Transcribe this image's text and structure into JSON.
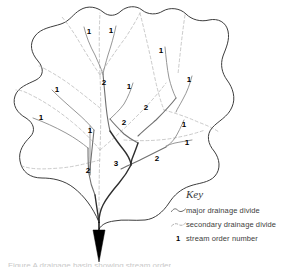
{
  "figure": {
    "type": "drainage-basin-stream-order-diagram",
    "background_color": "#ffffff"
  },
  "legend": {
    "title": "Key",
    "items": [
      {
        "symbol": "wavy-solid-line",
        "label": "major drainage divide"
      },
      {
        "symbol": "dashed-line",
        "label": "secondary drainage divide"
      },
      {
        "symbol": "bold-number",
        "symbol_text": "1",
        "label": "stream order number"
      }
    ]
  },
  "colors": {
    "major_divide": "#3d3d3d",
    "secondary_divide": "#bdbdbd",
    "stream": "#8a8a8a",
    "trunk_stream": "#2e2e2e",
    "label_text": "#000000",
    "legend_text": "#3d3d3d",
    "outlet_arrow": "#000000"
  },
  "stream_order_labels": [
    {
      "text": "1",
      "x": 89,
      "y": 32
    },
    {
      "text": "1",
      "x": 111,
      "y": 31
    },
    {
      "text": "1",
      "x": 161,
      "y": 51
    },
    {
      "text": "2",
      "x": 104,
      "y": 83
    },
    {
      "text": "1",
      "x": 129,
      "y": 87
    },
    {
      "text": "1",
      "x": 189,
      "y": 80
    },
    {
      "text": "2",
      "x": 146,
      "y": 108
    },
    {
      "text": "1",
      "x": 57,
      "y": 90
    },
    {
      "text": "1",
      "x": 41,
      "y": 118
    },
    {
      "text": "1",
      "x": 90,
      "y": 131
    },
    {
      "text": "2",
      "x": 124,
      "y": 123
    },
    {
      "text": "1",
      "x": 184,
      "y": 125
    },
    {
      "text": "1",
      "x": 187,
      "y": 143
    },
    {
      "text": "2",
      "x": 157,
      "y": 159
    },
    {
      "text": "3",
      "x": 116,
      "y": 164
    },
    {
      "text": "2",
      "x": 88,
      "y": 171
    }
  ],
  "caption_sliver": "Figure  A drainage basin showing stream order"
}
